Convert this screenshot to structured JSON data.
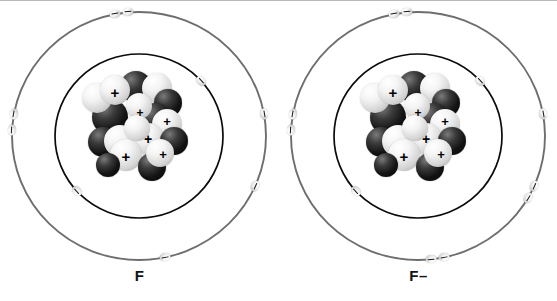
{
  "figure": {
    "type": "bohr-model-diagram",
    "background_color": "#ffffff",
    "top_border_color": "#b9b9b9"
  },
  "atoms": [
    {
      "id": "fluorine-atom",
      "label": "F",
      "name": "fluorine atom",
      "charge": "neutral",
      "center": {
        "x": 139,
        "y": 135
      },
      "shells": [
        {
          "name": "inner-shell",
          "radius": 84,
          "stroke": "#0b0b0b",
          "stroke_width": 1.7,
          "electron_count": 2
        },
        {
          "name": "outer-shell",
          "radius": 127,
          "stroke": "#6e6e6e",
          "stroke_width": 1.9,
          "electron_count": 7
        }
      ],
      "inner_electron_angles": [
        -42,
        138
      ],
      "outer_electron_angles": [
        -101,
        -95,
        -170,
        -177,
        -10,
        24,
        72,
        78
      ],
      "outer_electron_visible": [
        -101,
        -95,
        -170,
        -177,
        -10,
        24,
        78
      ],
      "nucleus": {
        "proton_symbol": "+",
        "proton_count_visible": 6,
        "neutron_color": "#141414",
        "proton_color": "#efefef"
      }
    },
    {
      "id": "fluoride-ion",
      "label": "F–",
      "name": "fluoride ion",
      "charge": "negative",
      "center": {
        "x": 139,
        "y": 135
      },
      "shells": [
        {
          "name": "inner-shell",
          "radius": 84,
          "stroke": "#0b0b0b",
          "stroke_width": 1.7,
          "electron_count": 2
        },
        {
          "name": "outer-shell",
          "radius": 127,
          "stroke": "#6e6e6e",
          "stroke_width": 1.9,
          "electron_count": 8
        }
      ],
      "inner_electron_angles": [
        -42,
        138
      ],
      "outer_electron_angles": [
        -101,
        -95,
        -170,
        -177,
        -10,
        24,
        30,
        78,
        84
      ],
      "nucleus": {
        "proton_symbol": "+",
        "proton_count_visible": 6,
        "neutron_color": "#141414",
        "proton_color": "#efefef"
      }
    }
  ],
  "nucleus_spheres": [
    {
      "kind": "neutron",
      "x": 40,
      "y": 2,
      "d": 32
    },
    {
      "kind": "neutron",
      "x": 12,
      "y": 30,
      "d": 36
    },
    {
      "kind": "proton",
      "x": 2,
      "y": 14,
      "d": 30
    },
    {
      "kind": "proton",
      "x": 62,
      "y": 4,
      "d": 30
    },
    {
      "kind": "neutron",
      "x": 74,
      "y": 20,
      "d": 28
    },
    {
      "kind": "proton",
      "x": 20,
      "y": 6,
      "d": 30,
      "plus": {
        "x": 35,
        "y": 23,
        "size": 15
      }
    },
    {
      "kind": "neutron",
      "x": 58,
      "y": 34,
      "d": 34
    },
    {
      "kind": "proton",
      "x": 46,
      "y": 24,
      "d": 26
    },
    {
      "kind": "proton",
      "x": 72,
      "y": 40,
      "d": 30,
      "plus": {
        "x": 87,
        "y": 52,
        "size": 13
      }
    },
    {
      "kind": "neutron",
      "x": 8,
      "y": 58,
      "d": 30
    },
    {
      "kind": "proton",
      "x": 24,
      "y": 56,
      "d": 32
    },
    {
      "kind": "proton",
      "x": 52,
      "y": 54,
      "d": 32,
      "plus": {
        "x": 68,
        "y": 70,
        "size": 14
      }
    },
    {
      "kind": "neutron",
      "x": 80,
      "y": 58,
      "d": 28
    },
    {
      "kind": "proton",
      "x": 30,
      "y": 70,
      "d": 32,
      "plus": {
        "x": 46,
        "y": 87,
        "size": 15
      }
    },
    {
      "kind": "neutron",
      "x": 58,
      "y": 84,
      "d": 28
    },
    {
      "kind": "proton",
      "x": 66,
      "y": 70,
      "d": 28,
      "plus": {
        "x": 83,
        "y": 85,
        "size": 13
      }
    },
    {
      "kind": "neutron",
      "x": 16,
      "y": 84,
      "d": 24
    },
    {
      "kind": "proton",
      "x": 44,
      "y": 46,
      "d": 26,
      "plus": {
        "x": 60,
        "y": 44,
        "size": 12
      }
    }
  ]
}
